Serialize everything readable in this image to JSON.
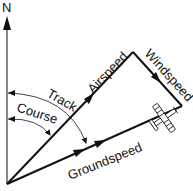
{
  "diagram": {
    "labels": {
      "north": "N",
      "airspeed": "Airspeed",
      "windspeed": "Windspeed",
      "track": "Track",
      "course": "Course",
      "groundspeed": "Groundspeed"
    },
    "icons": {
      "airplane": "airplane-icon"
    },
    "colors": {
      "line": "#111111",
      "background": "#ffffff"
    }
  }
}
